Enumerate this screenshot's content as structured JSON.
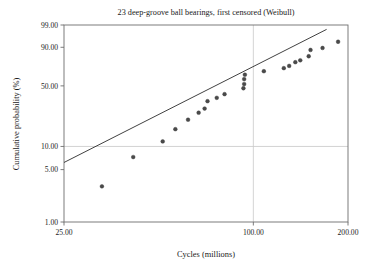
{
  "chart_data": {
    "type": "scatter",
    "title": "23 deep-groove ball bearings, first censored (Weibull)",
    "xlabel": "Cycles (millions)",
    "ylabel": "Cumulative probability (%)",
    "x_scale": "log",
    "y_scale": "weibull-probability",
    "xlim": [
      25.0,
      200.0
    ],
    "ylim": [
      1.0,
      99.0
    ],
    "xticks": [
      25.0,
      100.0,
      200.0
    ],
    "xticklabels": [
      "25.00",
      "100.00",
      "200.00"
    ],
    "yticks": [
      1.0,
      5.0,
      10.0,
      50.0,
      90.0,
      99.0
    ],
    "yticklabels": [
      "1.00",
      "5.00",
      "10.00",
      "50.00",
      "90.00",
      "99.00"
    ],
    "grid": true,
    "gridlines_x": [
      100.0
    ],
    "gridlines_y": [
      10.0
    ],
    "legend": false,
    "marker": "filled-circle",
    "marker_color": "#4a4a4a",
    "line_color": "#2b2b2b",
    "points": [
      {
        "x": 33.0,
        "y": 3.0
      },
      {
        "x": 41.5,
        "y": 7.3
      },
      {
        "x": 51.5,
        "y": 11.6
      },
      {
        "x": 56.5,
        "y": 16.5
      },
      {
        "x": 62.0,
        "y": 21.5
      },
      {
        "x": 67.0,
        "y": 26.0
      },
      {
        "x": 70.0,
        "y": 29.0
      },
      {
        "x": 71.5,
        "y": 35.0
      },
      {
        "x": 76.5,
        "y": 38.0
      },
      {
        "x": 81.0,
        "y": 41.5
      },
      {
        "x": 93.0,
        "y": 47.5
      },
      {
        "x": 93.5,
        "y": 52.0
      },
      {
        "x": 93.5,
        "y": 57.5
      },
      {
        "x": 94.0,
        "y": 62.5
      },
      {
        "x": 108.0,
        "y": 66.5
      },
      {
        "x": 125.0,
        "y": 70.0
      },
      {
        "x": 130.0,
        "y": 72.5
      },
      {
        "x": 136.0,
        "y": 76.5
      },
      {
        "x": 141.0,
        "y": 78.5
      },
      {
        "x": 150.0,
        "y": 82.5
      },
      {
        "x": 152.0,
        "y": 88.0
      },
      {
        "x": 166.0,
        "y": 89.5
      },
      {
        "x": 186.0,
        "y": 93.5
      }
    ],
    "fit_line": {
      "label": "weibull-fit-line",
      "endpoints": [
        {
          "x": 25.0,
          "y": 6.2
        },
        {
          "x": 171.0,
          "y": 98.2
        }
      ]
    },
    "n_points": 23
  },
  "colors": {
    "axis": "#6e6e6e",
    "grid": "#c8c8c8",
    "text": "#1a1a1a",
    "marker": "#4a4a4a",
    "line": "#2b2b2b",
    "background": "#ffffff"
  }
}
